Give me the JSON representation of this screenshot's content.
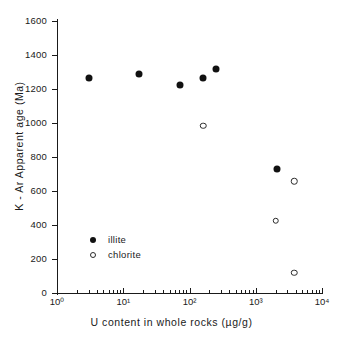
{
  "chart_data": {
    "type": "scatter",
    "title": "",
    "xlabel": "U content in whole rocks (µg/g)",
    "ylabel": "K - Ar Apparent age (Ma)",
    "xscale": "log",
    "yscale": "linear",
    "xlim": [
      1,
      10000
    ],
    "ylim": [
      0,
      1700
    ],
    "grid": false,
    "legend_position": "lower-left-inside",
    "x_tick_labels": [
      "10⁰",
      "10¹",
      "10²",
      "10³",
      "10⁴"
    ],
    "x_tick_values": [
      1,
      10,
      100,
      1000,
      10000
    ],
    "y_tick_labels": [
      "0",
      "200",
      "400",
      "600",
      "800",
      "1000",
      "1200",
      "1400",
      "1600"
    ],
    "y_tick_values": [
      0,
      200,
      400,
      600,
      800,
      1000,
      1200,
      1400,
      1600
    ],
    "series": [
      {
        "name": "illite",
        "marker": "filled-circle",
        "color": "#111111",
        "points": [
          {
            "x": 3.0,
            "y": 1265
          },
          {
            "x": 17,
            "y": 1290
          },
          {
            "x": 72,
            "y": 1225
          },
          {
            "x": 160,
            "y": 1265
          },
          {
            "x": 250,
            "y": 1320
          },
          {
            "x": 2100,
            "y": 730
          }
        ]
      },
      {
        "name": "chlorite",
        "marker": "open-circle",
        "color": "#2b2b2b",
        "points": [
          {
            "x": 160,
            "y": 985
          },
          {
            "x": 2000,
            "y": 425
          },
          {
            "x": 3800,
            "y": 658
          },
          {
            "x": 3800,
            "y": 120
          }
        ]
      }
    ]
  },
  "axes": {
    "x_title": "U content in whole rocks (µg/g)",
    "y_title": "K - Ar Apparent age (Ma)"
  },
  "legend": {
    "entries": [
      {
        "label": "illite",
        "marker": "filled-circle"
      },
      {
        "label": "chlorite",
        "marker": "open-circle"
      }
    ]
  }
}
